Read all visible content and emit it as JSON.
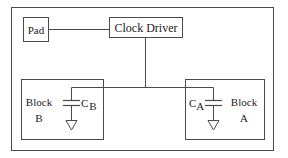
{
  "diagram": {
    "colors": {
      "line": "#4a4a4a",
      "text": "#222222",
      "background": "#ffffff"
    },
    "nodes": {
      "pad": {
        "label": "Pad"
      },
      "clock_driver": {
        "label": "Clock Driver"
      },
      "block_b": {
        "label_line1": "Block",
        "label_line2": "B",
        "cap_main": "C",
        "cap_sub": "B"
      },
      "block_a": {
        "label_line1": "Block",
        "label_line2": "A",
        "cap_main": "C",
        "cap_sub": "A"
      }
    },
    "edges": [
      {
        "from": "Pad",
        "to": "Clock Driver"
      },
      {
        "from": "Clock Driver",
        "to": "Block B capacitor C_B"
      },
      {
        "from": "Clock Driver",
        "to": "Block A capacitor C_A"
      }
    ]
  }
}
